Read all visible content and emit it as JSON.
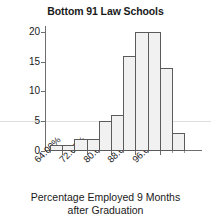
{
  "chart_data": {
    "type": "bar",
    "title": "Bottom 91 Law Schools",
    "xlabel_line1": "Percentage Employed 9 Months",
    "xlabel_line2": "after Graduation",
    "ylabel": "Frequency",
    "categories": [
      "60.00%",
      "64.00%",
      "68.00%",
      "72.00%",
      "76.00%",
      "80.00%",
      "84.00%",
      "88.00%",
      "92.00%",
      "96.00%",
      "100.00%"
    ],
    "values": [
      1,
      1,
      2,
      2,
      5,
      6,
      16,
      20,
      20,
      14,
      3
    ],
    "bin_width": "4.00%",
    "xtick_labels": [
      "64.00%",
      "72.00%",
      "80.00%",
      "88.00%",
      "96.00%"
    ],
    "ytick_labels": [
      "0",
      "5",
      "10",
      "15",
      "20"
    ],
    "ytick_values": [
      0,
      5,
      10,
      15,
      20
    ],
    "ylim": [
      0,
      21
    ],
    "xlim": [
      "60.00%",
      "104.00%"
    ],
    "grid": "single horizontal gridline at y=5",
    "legend": "none",
    "bar_fill_color": "#f1f1f1",
    "bar_edge_color": "#5b5b5b",
    "axis_color": "#6e6e6e",
    "text_color": "#1a1a1a",
    "background_color": "#ffffff"
  }
}
